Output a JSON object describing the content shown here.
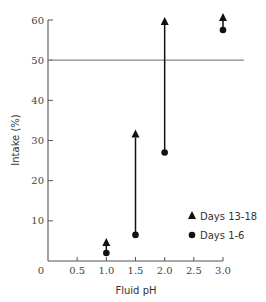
{
  "chart_data": {
    "type": "scatter",
    "title": "",
    "xlabel": "Fluid pH",
    "ylabel": "Intake (%)",
    "xlim": [
      0,
      3.0
    ],
    "ylim": [
      0,
      60
    ],
    "x_ticks": [
      "0",
      "0.5",
      "1.0",
      "1.5",
      "2.0",
      "2.5",
      "3.0"
    ],
    "y_ticks": [
      "10",
      "20",
      "30",
      "40",
      "50",
      "60"
    ],
    "grid": false,
    "reference_line": {
      "y": 50
    },
    "legend_position": "lower right",
    "series": [
      {
        "name": "Days 13-18",
        "marker": "triangle",
        "x": [
          1.0,
          1.5,
          2.0,
          3.0
        ],
        "values": [
          5,
          32,
          60,
          61
        ]
      },
      {
        "name": "Days 1-6",
        "marker": "circle",
        "x": [
          1.0,
          1.5,
          2.0,
          3.0
        ],
        "values": [
          2,
          6.5,
          27,
          57.5
        ]
      }
    ],
    "annotations": "Arrows connect Days 1-6 value to Days 13-18 value at each pH"
  },
  "legend": {
    "items": [
      {
        "label": "Days 13-18"
      },
      {
        "label": "Days 1-6"
      }
    ]
  }
}
